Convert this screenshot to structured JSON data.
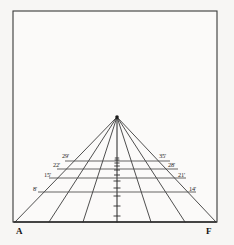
{
  "figure": {
    "name": "perspective-grid-diagram",
    "background_color": "#f7f6f4",
    "paper_color": "#fbfaf9",
    "line_color": "#2f2f2f",
    "frame": {
      "x": 13,
      "y": 11,
      "width": 204,
      "height": 211
    }
  },
  "corners": {
    "left_label": "A",
    "right_label": "F",
    "left_pos": {
      "x": 16,
      "y": 234
    },
    "right_pos": {
      "x": 206,
      "y": 234
    }
  },
  "vanishing_point": {
    "x": 117,
    "y": 117,
    "label": ""
  },
  "baseline": {
    "y": 222,
    "x_start": 14,
    "x_end": 216
  },
  "left_labels": [
    {
      "text": "8'",
      "x": 33,
      "y": 191
    },
    {
      "text": "15'",
      "x": 44,
      "y": 177
    },
    {
      "text": "22'",
      "x": 53,
      "y": 167
    },
    {
      "text": "29'",
      "x": 62,
      "y": 158
    }
  ],
  "right_labels": [
    {
      "text": "14'",
      "x": 189,
      "y": 191
    },
    {
      "text": "21'",
      "x": 178,
      "y": 177
    },
    {
      "text": "28'",
      "x": 168,
      "y": 167
    },
    {
      "text": "35'",
      "x": 159,
      "y": 158
    }
  ],
  "horizontal_lines": [
    {
      "y": 192,
      "x_start": 38,
      "x_end": 196
    },
    {
      "y": 178,
      "x_start": 49,
      "x_end": 186
    },
    {
      "y": 169,
      "x_start": 57,
      "x_end": 178
    },
    {
      "y": 161,
      "x_start": 65,
      "x_end": 170
    }
  ],
  "rays": [
    {
      "baseline_x": 15
    },
    {
      "baseline_x": 49
    },
    {
      "baseline_x": 83
    },
    {
      "baseline_x": 117
    },
    {
      "baseline_x": 151
    },
    {
      "baseline_x": 185
    },
    {
      "baseline_x": 216
    }
  ],
  "center_ticks": [
    {
      "y": 216,
      "half_width": 3.5
    },
    {
      "y": 206,
      "half_width": 3.5
    },
    {
      "y": 196,
      "half_width": 3.5
    },
    {
      "y": 188,
      "half_width": 3.5
    },
    {
      "y": 181,
      "half_width": 3.5
    },
    {
      "y": 175,
      "half_width": 3.0
    },
    {
      "y": 170,
      "half_width": 3.0
    },
    {
      "y": 166,
      "half_width": 2.8
    },
    {
      "y": 163,
      "half_width": 2.6
    },
    {
      "y": 160,
      "half_width": 2.4
    },
    {
      "y": 158,
      "half_width": 2.2
    }
  ]
}
